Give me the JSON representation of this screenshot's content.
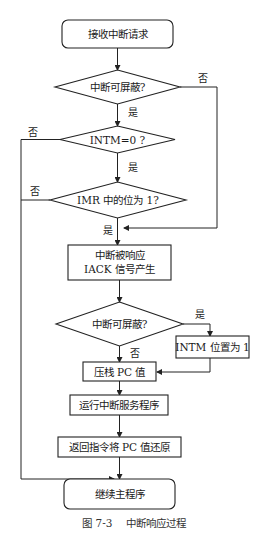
{
  "figure": {
    "caption": "图 7-3    中断响应过程"
  },
  "nodes": {
    "start": "接收中断请求",
    "d1": "中断可屏蔽?",
    "d2": "INTM=0 ?",
    "d3": "IMR 中的位为 1?",
    "p1_line1": "中断被响应",
    "p1_line2": "IACK 信号产生",
    "d4": "中断可屏蔽?",
    "p_intm": "INTM 位置为 1",
    "p2": "压栈 PC 值",
    "p3": "运行中断服务程序",
    "p4": "返回指令将 PC 值还原",
    "end": "继续主程序"
  },
  "edges": {
    "d1_no": "否",
    "d1_yes": "是",
    "d2_no": "否",
    "d2_yes": "是",
    "d3_no": "否",
    "d3_yes": "是",
    "d4_yes": "是",
    "d4_no": "否"
  }
}
